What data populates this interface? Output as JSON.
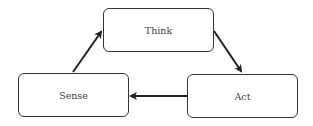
{
  "diagram": {
    "type": "cycle",
    "nodes": [
      {
        "id": "think",
        "label": "Think"
      },
      {
        "id": "act",
        "label": "Act"
      },
      {
        "id": "sense",
        "label": "Sense"
      }
    ],
    "edges": [
      {
        "from": "sense",
        "to": "think"
      },
      {
        "from": "think",
        "to": "act"
      },
      {
        "from": "act",
        "to": "sense"
      }
    ],
    "colors": {
      "stroke": "#333333",
      "text": "#444444",
      "background": "#ffffff"
    }
  }
}
